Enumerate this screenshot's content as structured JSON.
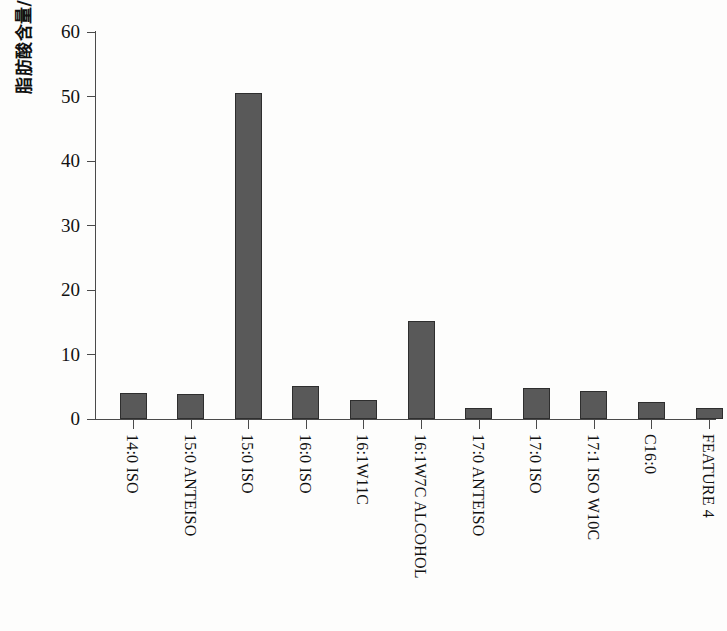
{
  "chart_data": {
    "type": "bar",
    "title": "",
    "xlabel": "",
    "ylabel": "脂肪酸含量/%",
    "ylim": [
      0,
      60
    ],
    "ytick_values": [
      0,
      10,
      20,
      30,
      40,
      50,
      60
    ],
    "ytick_labels": [
      "0",
      "10",
      "20",
      "30",
      "40",
      "50",
      "60"
    ],
    "grid": false,
    "legend": false,
    "bar_color": "#595959",
    "bar_edge_color": "#2e2e2e",
    "axis_color": "#4a4a4a",
    "categories": [
      "14:0 ISO",
      "15:0 ANTEISO",
      "15:0 ISO",
      "16:0 ISO",
      "16:1W11C",
      "16:1W7C ALCOHOL",
      "17:0 ANTEISO",
      "17:0 ISO",
      "17:1 ISO W10C",
      "C16:0",
      "FEATURE 4"
    ],
    "values": [
      4.1,
      3.8,
      50.6,
      5.1,
      2.9,
      15.2,
      1.7,
      4.8,
      4.4,
      2.7,
      1.7
    ]
  }
}
